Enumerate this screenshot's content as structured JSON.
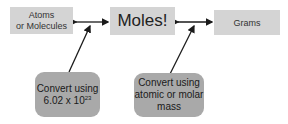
{
  "nodes": {
    "atoms": {
      "line1": "Atoms",
      "line2": "or Molecules"
    },
    "moles": {
      "label": "Moles!"
    },
    "grams": {
      "label": "Grams"
    }
  },
  "notes": {
    "avogadro": {
      "line1": "Convert using",
      "line2_base": "6.02 x 10",
      "line2_exp": "23"
    },
    "molar": {
      "line1": "Convert using",
      "line2": "atomic or molar",
      "line3": "mass"
    }
  },
  "colors": {
    "node_fill": "#d4d4d4",
    "note_fill": "#a9a9a9",
    "arrow": "#1a1a1a"
  }
}
